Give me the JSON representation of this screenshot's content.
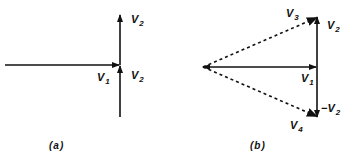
{
  "diagram": {
    "colors": {
      "stroke": "#111111",
      "background": "#ffffff"
    },
    "panels": [
      {
        "id": "a",
        "caption": "(a)",
        "vectors": [
          {
            "name": "V1",
            "style": "solid",
            "from": [
              5,
              65
            ],
            "to": [
              120,
              65
            ]
          },
          {
            "name": "V2",
            "style": "solid",
            "from": [
              120,
              117
            ],
            "to": [
              120,
              65
            ],
            "note": "lower V2 arrow into junction"
          },
          {
            "name": "V2",
            "style": "solid",
            "from": [
              120,
              65
            ],
            "to": [
              120,
              15
            ],
            "note": "upper V2 arrow"
          }
        ],
        "labels": [
          {
            "text": "V",
            "sub": "2",
            "pos": [
              131,
              15
            ]
          },
          {
            "text": "V",
            "sub": "1",
            "pos": [
              97,
              72
            ]
          },
          {
            "text": "V",
            "sub": "2",
            "pos": [
              131,
              70
            ]
          }
        ]
      },
      {
        "id": "b",
        "caption": "(b)",
        "vectors": [
          {
            "name": "V1",
            "style": "solid",
            "from": [
              203,
              67
            ],
            "to": [
              317,
              67
            ]
          },
          {
            "name": "V2",
            "style": "solid",
            "from": [
              317,
              67
            ],
            "to": [
              317,
              17
            ]
          },
          {
            "name": "-V2",
            "style": "solid",
            "from": [
              317,
              67
            ],
            "to": [
              317,
              117
            ]
          },
          {
            "name": "V3",
            "style": "dashed",
            "from": [
              203,
              67
            ],
            "to": [
              317,
              17
            ]
          },
          {
            "name": "V4",
            "style": "dashed",
            "from": [
              203,
              67
            ],
            "to": [
              317,
              117
            ]
          }
        ],
        "labels": [
          {
            "text": "V",
            "sub": "3",
            "pos": [
              285,
              8
            ]
          },
          {
            "text": "V",
            "sub": "2",
            "pos": [
              327,
              20
            ]
          },
          {
            "text": "V",
            "sub": "1",
            "pos": [
              302,
              73
            ]
          },
          {
            "text": "−V",
            "sub": "2",
            "pos": [
              321,
              103
            ]
          },
          {
            "text": "V",
            "sub": "4",
            "pos": [
              290,
              120
            ]
          }
        ]
      }
    ]
  },
  "labels": {
    "a_v2_top": "V",
    "a_v2_top_sub": "2",
    "a_v1": "V",
    "a_v1_sub": "1",
    "a_v2_bot": "V",
    "a_v2_bot_sub": "2",
    "b_v3": "V",
    "b_v3_sub": "3",
    "b_v2": "V",
    "b_v2_sub": "2",
    "b_v1": "V",
    "b_v1_sub": "1",
    "b_neg_v2": "−V",
    "b_neg_v2_sub": "2",
    "b_v4": "V",
    "b_v4_sub": "4",
    "caption_a": "(a)",
    "caption_b": "(b)"
  }
}
